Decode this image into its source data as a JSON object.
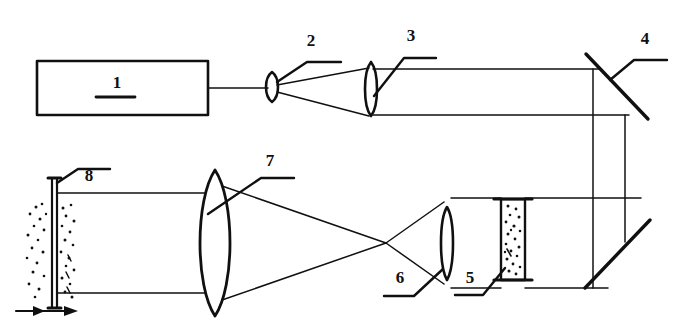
{
  "figure": {
    "type": "optical-ray-diagram",
    "canvas": {
      "width": 685,
      "height": 328
    },
    "ink_color": "#101010",
    "background_color": "#ffffff"
  },
  "labels": [
    {
      "id": "1",
      "text": "1",
      "x": 117,
      "y": 88,
      "component": "laser-source-box",
      "has_leader": false,
      "underline": true
    },
    {
      "id": "2",
      "text": "2",
      "x": 311,
      "y": 46,
      "component": "lens-2",
      "has_leader": true
    },
    {
      "id": "3",
      "text": "3",
      "x": 411,
      "y": 41,
      "component": "lens-3",
      "has_leader": true
    },
    {
      "id": "4",
      "text": "4",
      "x": 645,
      "y": 44,
      "component": "mirror-4",
      "has_leader": true
    },
    {
      "id": "5",
      "text": "5",
      "x": 470,
      "y": 283,
      "component": "sample-cell-5",
      "has_leader": true
    },
    {
      "id": "6",
      "text": "6",
      "x": 400,
      "y": 283,
      "component": "lens-6",
      "has_leader": true
    },
    {
      "id": "7",
      "text": "7",
      "x": 270,
      "y": 165,
      "component": "lens-7",
      "has_leader": true
    },
    {
      "id": "8",
      "text": "8",
      "x": 89,
      "y": 180,
      "component": "screen-8",
      "has_leader": true
    }
  ],
  "components": {
    "laser_source": {
      "name": "laser-source-box",
      "x": 37,
      "y": 61,
      "width": 171,
      "height": 54
    },
    "lens_2": {
      "name": "lens-2",
      "cx": 272,
      "cy": 87,
      "rx": 7,
      "ry": 15
    },
    "lens_3": {
      "name": "lens-3",
      "cx": 371,
      "cy": 89,
      "rx": 6,
      "ry": 27
    },
    "mirror_4": {
      "name": "mirror-4",
      "x1": 587,
      "y1": 55,
      "x2": 645,
      "y2": 117
    },
    "mirror_lower": {
      "name": "mirror-lower",
      "x1": 587,
      "y1": 285,
      "x2": 648,
      "y2": 222
    },
    "sample_cell_5": {
      "name": "sample-cell-5",
      "x": 501,
      "y": 199,
      "width": 24,
      "height": 81
    },
    "lens_6": {
      "name": "lens-6",
      "cx": 447,
      "cy": 243,
      "rx": 6,
      "ry": 36
    },
    "lens_7": {
      "name": "lens-7",
      "cx": 215,
      "cy": 243,
      "rx": 16,
      "ry": 73
    },
    "screen_8": {
      "name": "screen-8",
      "x": 52,
      "y": 178,
      "width": 5,
      "height": 130
    },
    "flow_arrow": {
      "name": "flow-direction-arrow",
      "x1": 16,
      "y1": 311,
      "x2": 78,
      "y2": 311
    }
  },
  "beam_paths": {
    "description": "Collimated laser beam from source 1 is focused by lens 2, expanded and recollimated by lens 3, folded by mirror 4 down and back via lower mirror, passes through sample cell 5, focused by lens 6, crosses at a focal point, then expanded by lens 7 onto screen 8.",
    "top_axis_y": 89,
    "upper_beam_y": 70,
    "lower_beam_y": 115,
    "bottom_upper_beam_y": 198,
    "bottom_lower_beam_y": 288,
    "vertical_left_x": 593,
    "vertical_right_x": 625,
    "crossover_x": 386,
    "crossover_y": 243
  }
}
